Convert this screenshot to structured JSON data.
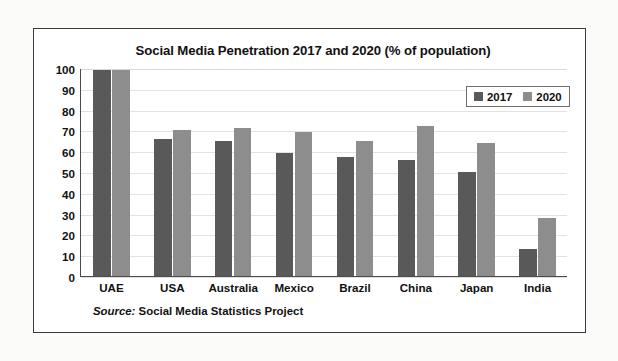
{
  "figure": {
    "source_label": "Source:",
    "source_text": "Social Media Statistics Project"
  },
  "legend": {
    "position": "top-right-inside",
    "entries": [
      {
        "name": "2017",
        "color": "#595959"
      },
      {
        "name": "2020",
        "color": "#8d8d8d"
      }
    ]
  },
  "chart_data": {
    "type": "bar",
    "title": "Social Media Penetration 2017 and 2020 (% of population)",
    "xlabel": "",
    "ylabel": "",
    "ylim": [
      0,
      100
    ],
    "yticks": [
      0,
      10,
      20,
      30,
      40,
      50,
      60,
      70,
      80,
      90,
      100
    ],
    "grid": true,
    "legend_position": "upper right",
    "categories": [
      "UAE",
      "USA",
      "Australia",
      "Mexico",
      "Brazil",
      "China",
      "Japan",
      "India"
    ],
    "series": [
      {
        "name": "2017",
        "color": "#595959",
        "values": [
          99,
          66,
          65,
          59,
          57,
          56,
          50,
          13
        ]
      },
      {
        "name": "2020",
        "color": "#8d8d8d",
        "values": [
          99,
          70,
          71,
          69,
          65,
          72,
          64,
          28
        ]
      }
    ]
  }
}
